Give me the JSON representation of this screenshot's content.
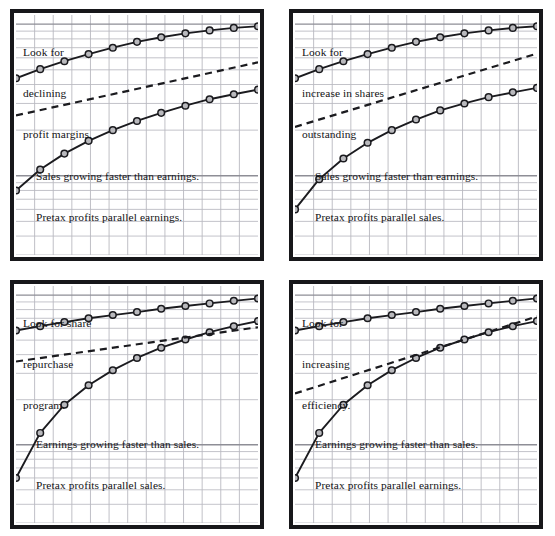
{
  "figure": {
    "background_color": "#ffffff",
    "frame_color": "#17171a",
    "grid_color": "#b9b9c0",
    "grid_major_color": "#8e8e96",
    "line_color": "#1b1b1f",
    "marker_fill": "#b9b9bd",
    "marker_stroke": "#1b1b1f",
    "dashed_color": "#1b1b1f",
    "rows": 2,
    "columns": 2
  },
  "panels": [
    {
      "id": "panel-top-left",
      "position": "top-left",
      "headnote": [
        "Look for",
        "declining",
        "profit margins."
      ],
      "footnote": [
        "Sales growing faster than earnings.",
        "Pretax profits parallel earnings."
      ]
    },
    {
      "id": "panel-top-right",
      "position": "top-right",
      "headnote": [
        "Look for",
        "increase in shares",
        "outstanding"
      ],
      "footnote": [
        "Sales growing faster than earnings.",
        "Pretax profits parallel sales."
      ]
    },
    {
      "id": "panel-bottom-left",
      "position": "bottom-left",
      "headnote": [
        "Look for share",
        "repurchase",
        "program."
      ],
      "footnote": [
        "Earnings growing faster than sales.",
        "Pretax profits parallel sales."
      ]
    },
    {
      "id": "panel-bottom-right",
      "position": "bottom-right",
      "headnote": [
        "Look for",
        "increasing",
        "efficiency."
      ],
      "footnote": [
        "Earnings growing faster than sales.",
        "Pretax profits parallel earnings."
      ]
    }
  ],
  "chart_data": [
    {
      "panel": "panel-top-left",
      "type": "line",
      "scale": "semi-log",
      "title": "Look for declining profit margins.",
      "subtitle": "Sales growing faster than earnings. Pretax profits parallel earnings.",
      "xlabel": "",
      "ylabel": "",
      "grid": true,
      "legend": false,
      "xlim": [
        0,
        10
      ],
      "ylim": [
        0,
        100
      ],
      "x": [
        0,
        1,
        2,
        3,
        4,
        5,
        6,
        7,
        8,
        9,
        10
      ],
      "series": [
        {
          "name": "Sales",
          "style": "solid-with-markers",
          "marker": "circle",
          "values": [
            44.0,
            50.5,
            57.0,
            63.5,
            70.0,
            76.5,
            82.0,
            87.0,
            91.0,
            94.5,
            97.0
          ]
        },
        {
          "name": "Earnings",
          "style": "solid-with-markers",
          "marker": "circle",
          "values": [
            8.0,
            11.0,
            14.0,
            17.0,
            20.0,
            23.0,
            26.0,
            29.0,
            32.0,
            34.5,
            37.0
          ]
        },
        {
          "name": "Pretax profits",
          "style": "dashed",
          "marker": "none",
          "x": [
            0,
            10
          ],
          "values": [
            25.0,
            56.0
          ]
        }
      ]
    },
    {
      "panel": "panel-top-right",
      "type": "line",
      "scale": "semi-log",
      "title": "Look for increase in shares outstanding",
      "subtitle": "Sales growing faster than earnings. Pretax profits parallel sales.",
      "xlabel": "",
      "ylabel": "",
      "grid": true,
      "legend": false,
      "xlim": [
        0,
        10
      ],
      "ylim": [
        0,
        100
      ],
      "x": [
        0,
        1,
        2,
        3,
        4,
        5,
        6,
        7,
        8,
        9,
        10
      ],
      "series": [
        {
          "name": "Sales",
          "style": "solid-with-markers",
          "marker": "circle",
          "values": [
            44.0,
            50.5,
            57.0,
            63.5,
            70.0,
            76.5,
            82.0,
            87.0,
            91.0,
            94.5,
            97.0
          ]
        },
        {
          "name": "Earnings",
          "style": "solid-with-markers",
          "marker": "circle",
          "values": [
            6.0,
            9.5,
            13.0,
            16.5,
            20.0,
            23.5,
            27.0,
            30.0,
            33.0,
            35.5,
            38.0
          ]
        },
        {
          "name": "Pretax profits",
          "style": "dashed",
          "marker": "none",
          "x": [
            0,
            10
          ],
          "values": [
            21.0,
            64.0
          ]
        }
      ]
    },
    {
      "panel": "panel-bottom-left",
      "type": "line",
      "scale": "semi-log",
      "title": "Look for share repurchase program.",
      "subtitle": "Earnings growing faster than sales. Pretax profits parallel sales.",
      "xlabel": "",
      "ylabel": "",
      "grid": true,
      "legend": false,
      "xlim": [
        0,
        10
      ],
      "ylim": [
        0,
        100
      ],
      "x": [
        0,
        1,
        2,
        3,
        4,
        5,
        6,
        7,
        8,
        9,
        10
      ],
      "series": [
        {
          "name": "Sales",
          "style": "solid-with-markers",
          "marker": "circle",
          "values": [
            58.0,
            62.0,
            66.0,
            70.0,
            73.5,
            77.0,
            81.0,
            84.5,
            88.0,
            91.5,
            95.0
          ]
        },
        {
          "name": "Earnings",
          "style": "solid-with-markers",
          "marker": "circle",
          "values": [
            6.0,
            12.0,
            18.5,
            25.0,
            31.5,
            38.0,
            44.5,
            50.5,
            56.5,
            62.0,
            67.0
          ]
        },
        {
          "name": "Pretax profits",
          "style": "dashed",
          "marker": "none",
          "x": [
            0,
            10
          ],
          "values": [
            36.0,
            61.0
          ]
        }
      ]
    },
    {
      "panel": "panel-bottom-right",
      "type": "line",
      "scale": "semi-log",
      "title": "Look for increasing efficiency.",
      "subtitle": "Earnings growing faster than sales. Pretax profits parallel earnings.",
      "xlabel": "",
      "ylabel": "",
      "grid": true,
      "legend": false,
      "xlim": [
        0,
        10
      ],
      "ylim": [
        0,
        100
      ],
      "x": [
        0,
        1,
        2,
        3,
        4,
        5,
        6,
        7,
        8,
        9,
        10
      ],
      "series": [
        {
          "name": "Sales",
          "style": "solid-with-markers",
          "marker": "circle",
          "values": [
            58.0,
            62.0,
            66.0,
            70.0,
            73.5,
            77.0,
            81.0,
            84.5,
            88.0,
            91.5,
            95.0
          ]
        },
        {
          "name": "Earnings",
          "style": "solid-with-markers",
          "marker": "circle",
          "values": [
            6.0,
            12.0,
            18.5,
            25.0,
            31.5,
            38.0,
            44.5,
            50.5,
            56.5,
            62.0,
            67.0
          ]
        },
        {
          "name": "Pretax profits",
          "style": "dashed",
          "marker": "none",
          "x": [
            0,
            10
          ],
          "values": [
            22.0,
            72.0
          ]
        }
      ]
    }
  ]
}
